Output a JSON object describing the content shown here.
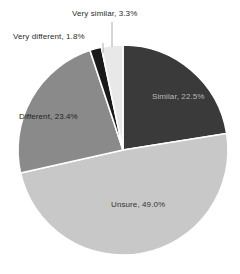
{
  "chart_data": {
    "type": "pie",
    "title": "",
    "categories": [
      "Similar",
      "Unsure",
      "Different",
      "Very different",
      "Very similar"
    ],
    "values": [
      22.5,
      49.0,
      23.4,
      1.8,
      3.3
    ],
    "value_unit": "%",
    "legend": "none",
    "grid": false,
    "start_angle_deg": 0,
    "direction": "clockwise",
    "slices": [
      {
        "name": "Similar",
        "label": "Similar, 22.5%",
        "value": 22.5,
        "color": "#3a3a3a",
        "text_color": "#b9b9b9",
        "label_placement": "inside",
        "label_x": 152,
        "label_y": 99
      },
      {
        "name": "Unsure",
        "label": "Unsure, 49.0%",
        "value": 49.0,
        "color": "#c8c8c8",
        "text_color": "#333333",
        "label_placement": "inside",
        "label_x": 111,
        "label_y": 207
      },
      {
        "name": "Different",
        "label": "Different, 23.4%",
        "value": 23.4,
        "color": "#8a8a8a",
        "text_color": "#242424",
        "label_placement": "inside",
        "label_x": 19,
        "label_y": 119
      },
      {
        "name": "Very different",
        "label": "Very different, 1.8%",
        "value": 1.8,
        "color": "#1a1a1a",
        "text_color": "#2b2b2b",
        "label_placement": "callout",
        "leader": {
          "x1": 103,
          "y1": 43,
          "x2": 103,
          "y2": 53
        }
      },
      {
        "name": "Very similar",
        "label": "Very similar, 3.3%",
        "value": 3.3,
        "color": "#e8e8e8",
        "text_color": "#2b2b2b",
        "label_placement": "callout",
        "leader": {
          "x1": 112,
          "y1": 22,
          "x2": 112,
          "y2": 47
        }
      }
    ],
    "geometry": {
      "center_x": 123,
      "center_y": 150,
      "radius": 105,
      "separator_color": "#ffffff",
      "separator_width": 1.6
    },
    "background": "#ffffff"
  }
}
